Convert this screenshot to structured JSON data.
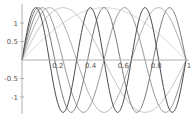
{
  "chart_data": {
    "type": "line",
    "title": "",
    "xlabel": "",
    "ylabel": "",
    "xlim": [
      0,
      1
    ],
    "ylim": [
      -1.4,
      1.4
    ],
    "grid": false,
    "legend": null,
    "x_ticks": [
      0.2,
      0.4,
      0.6,
      0.8,
      1
    ],
    "x_tick_labels": [
      "0.2",
      "0.4",
      "0.6",
      "0.8",
      "1"
    ],
    "y_ticks": [
      1,
      0.5,
      -0.5,
      -1
    ],
    "y_tick_labels": [
      "1",
      "0.5",
      "-0.5",
      "-1"
    ],
    "function": "sqrt(2)*sin(k*pi*x)",
    "series": [
      {
        "name": "k=1",
        "k": 1,
        "amplitude": 1.414,
        "color": "#d4d4d4"
      },
      {
        "name": "k=2",
        "k": 2,
        "amplitude": 1.414,
        "color": "#c2c2c2"
      },
      {
        "name": "k=3",
        "k": 3,
        "amplitude": 1.414,
        "color": "#adadad"
      },
      {
        "name": "k=4",
        "k": 4,
        "amplitude": 1.414,
        "color": "#959595"
      },
      {
        "name": "k=5",
        "k": 5,
        "amplitude": 1.414,
        "color": "#7a7a7a"
      },
      {
        "name": "k=6",
        "k": 6,
        "amplitude": 1.414,
        "color": "#4a4a4a"
      }
    ]
  },
  "layout": {
    "x0_px": 22,
    "x1_px": 186,
    "y_zero_px": 60,
    "px_per_unit": 37,
    "axis_color": "#b0b0b0"
  }
}
